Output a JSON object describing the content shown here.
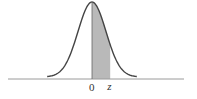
{
  "figure": {
    "distribution": "standard normal",
    "shaded_region": {
      "from": "0",
      "to": "z"
    },
    "labels": {
      "zero": "0",
      "z": "z"
    },
    "colors": {
      "curve": "#444444",
      "shade": "#b9b9b9",
      "axis": "#9a9a9a"
    },
    "domain": [
      -3.2,
      3.2
    ],
    "z_value": 1.3
  }
}
